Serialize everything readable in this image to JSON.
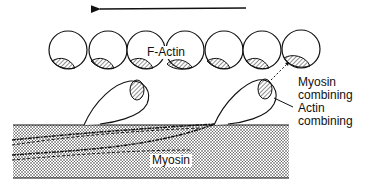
{
  "diagram": {
    "direction_arrow": "leftward movement of actin filament",
    "labels": {
      "f_actin": "F-Actin",
      "myosin_combining": "Myosin",
      "myosin_combining_2": "combining",
      "actin_combining": "Actin",
      "actin_combining_2": "combining",
      "myosin": "Myosin"
    },
    "actin_monomer_count": 7,
    "myosin_head_count": 2,
    "colors": {
      "line": "#111111",
      "background": "#ffffff"
    }
  }
}
